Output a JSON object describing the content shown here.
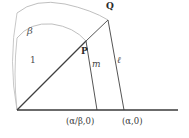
{
  "figure": {
    "type": "geometry-diagram",
    "background_color": "#ffffff",
    "line_color": "#4a4a4a",
    "arc_color": "#b0b0b0",
    "axis_color": "#3a3a3a",
    "label_color": "#3a3a3a"
  },
  "points": {
    "origin": {
      "x": 17,
      "y": 110,
      "label": ""
    },
    "P": {
      "x": 86,
      "y": 41,
      "label": "P"
    },
    "Q": {
      "x": 108,
      "y": 20,
      "label": "Q"
    },
    "foot_P": {
      "x": 97,
      "y": 110
    },
    "foot_Q": {
      "x": 124,
      "y": 110
    }
  },
  "axis": {
    "x_start": 17,
    "x_end": 178,
    "y": 110
  },
  "arcs": {
    "inner": {
      "label": "1",
      "radius": 72,
      "note": "unit arc from axis up to P"
    },
    "outer": {
      "label": "β",
      "radius": 97,
      "note": "arc of radius beta from axis up to Q"
    }
  },
  "labels": {
    "beta": "β",
    "one": "1",
    "P": "P",
    "Q": "Q",
    "m": "m",
    "ell": "ℓ",
    "coord_alpha_beta": "(α/β,0)",
    "coord_alpha": "(α,0)"
  }
}
